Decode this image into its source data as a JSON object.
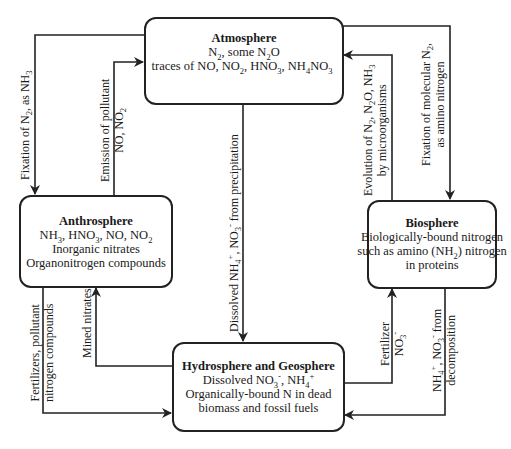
{
  "diagram": {
    "nodes": {
      "atmosphere": {
        "title": "Atmosphere",
        "line1": "N2, some N2O",
        "line2": "traces of NO, NO2, HNO3, NH4NO3"
      },
      "anthrosphere": {
        "title": "Anthrosphere",
        "line1": "NH3, HNO3, NO, NO2",
        "line2": "Inorganic nitrates",
        "line3": "Organonitrogen compounds"
      },
      "biosphere": {
        "title": "Biosphere",
        "line1": "Biologically-bound nitrogen",
        "line2": "such as amino (NH2) nitrogen",
        "line3": "in proteins"
      },
      "hydrosphere_geosphere": {
        "title": "Hydrosphere and Geosphere",
        "line1": "Dissolved NO3-, NH4+",
        "line2": "Organically-bound N in dead",
        "line3": "biomass and fossil fuels"
      }
    },
    "edges": [
      {
        "from": "atmosphere",
        "to": "anthrosphere",
        "label": "Fixation of N2, as NH3"
      },
      {
        "from": "anthrosphere",
        "to": "atmosphere",
        "label": "Emission of pollutant NO, NO2"
      },
      {
        "from": "atmosphere",
        "to": "hydrosphere_geosphere",
        "label": "Dissolved NH4+, NO3- from precipitation"
      },
      {
        "from": "biosphere",
        "to": "atmosphere",
        "label": "Evolution of N2, N2O, NH3 by microorganisms"
      },
      {
        "from": "atmosphere",
        "to": "biosphere",
        "label": "Fixation of molecular N2, as amino nitrogen"
      },
      {
        "from": "anthrosphere",
        "to": "hydrosphere_geosphere",
        "label": "Fertilizers, pollutant nitrogen compounds"
      },
      {
        "from": "hydrosphere_geosphere",
        "to": "anthrosphere",
        "label": "Mined nitrates"
      },
      {
        "from": "hydrosphere_geosphere",
        "to": "biosphere",
        "label": "Fertilizer NO3-"
      },
      {
        "from": "biosphere",
        "to": "hydrosphere_geosphere",
        "label": "NH4+, NO3- from decomposition"
      }
    ]
  }
}
